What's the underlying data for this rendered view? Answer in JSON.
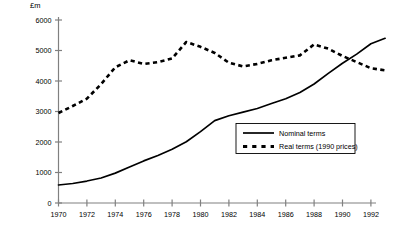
{
  "chart_data": {
    "type": "line",
    "title": "",
    "subtitle": "",
    "xlabel": "",
    "ylabel": "£m",
    "y_unit_label": "£m",
    "xlim": [
      1970,
      1993
    ],
    "ylim": [
      0,
      6000
    ],
    "y_ticks": [
      0,
      1000,
      2000,
      3000,
      4000,
      5000,
      6000
    ],
    "y_tick_labels": [
      "0",
      "1000",
      "2000",
      "3000",
      "4000",
      "5000",
      "6000"
    ],
    "x_ticks": [
      1970,
      1972,
      1974,
      1976,
      1978,
      1980,
      1982,
      1984,
      1986,
      1988,
      1990,
      1992
    ],
    "x_tick_labels": [
      "1970",
      "1972",
      "1974",
      "1976",
      "1978",
      "1980",
      "1982",
      "1984",
      "1986",
      "1988",
      "1990",
      "1992"
    ],
    "grid": false,
    "legend_position": "center-right",
    "x": [
      1970,
      1971,
      1972,
      1973,
      1974,
      1975,
      1976,
      1977,
      1978,
      1979,
      1980,
      1981,
      1982,
      1983,
      1984,
      1985,
      1986,
      1987,
      1988,
      1989,
      1990,
      1991,
      1992,
      1993
    ],
    "series": [
      {
        "name": "Nominal terms",
        "style": "solid",
        "color": "#000000",
        "values": [
          590,
          640,
          720,
          820,
          980,
          1180,
          1380,
          1560,
          1760,
          2010,
          2340,
          2700,
          2860,
          2980,
          3100,
          3260,
          3420,
          3620,
          3900,
          4250,
          4580,
          4880,
          5220,
          5400
        ]
      },
      {
        "name": "Real terms (1990 prices)",
        "style": "dashed",
        "color": "#000000",
        "values": [
          2950,
          3180,
          3420,
          3900,
          4450,
          4680,
          4560,
          4620,
          4740,
          5280,
          5120,
          4920,
          4600,
          4480,
          4560,
          4680,
          4760,
          4840,
          5200,
          5060,
          4820,
          4620,
          4420,
          4350
        ]
      }
    ]
  },
  "legend": {
    "items": [
      {
        "label": "Nominal terms",
        "style": "solid"
      },
      {
        "label": "Real terms (1990 prices)",
        "style": "dashed"
      }
    ]
  },
  "colors": {
    "line": "#000000",
    "axis": "#808080",
    "background": "#ffffff"
  }
}
